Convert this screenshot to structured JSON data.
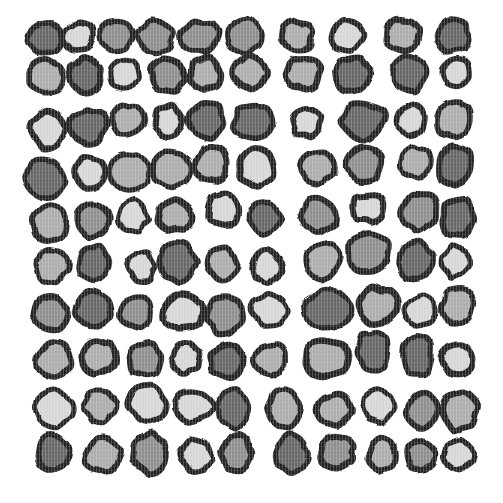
{
  "canvas": {
    "width": 503,
    "height": 503,
    "background": "#ffffff"
  },
  "palette": {
    "outline": "#212121",
    "fills": {
      "L": "#d6d6d6",
      "M": "#acacac",
      "D": "#8e8e8e",
      "K": "#666666"
    }
  },
  "render": {
    "stroke_width_min": 5.0,
    "stroke_width_max": 6.5,
    "wobble": 0.24,
    "points_per_blob": 12,
    "roughen_base_frequency": 0.045,
    "roughen_scale": 5
  },
  "pebble_fields": [
    "x",
    "y",
    "rx",
    "ry",
    "shade"
  ],
  "pebbles": [
    [
      45,
      38,
      17,
      16,
      "K"
    ],
    [
      79,
      37,
      15,
      14,
      "L"
    ],
    [
      116,
      37,
      16,
      15,
      "D"
    ],
    [
      155,
      37,
      18,
      16,
      "D"
    ],
    [
      200,
      37,
      18,
      16,
      "D"
    ],
    [
      245,
      36,
      17,
      16,
      "D"
    ],
    [
      297,
      36,
      16,
      15,
      "M"
    ],
    [
      348,
      35,
      16,
      15,
      "L"
    ],
    [
      403,
      36,
      17,
      16,
      "M"
    ],
    [
      452,
      36,
      17,
      16,
      "K"
    ],
    [
      47,
      77,
      18,
      17,
      "M"
    ],
    [
      85,
      75,
      17,
      17,
      "K"
    ],
    [
      125,
      74,
      15,
      15,
      "L"
    ],
    [
      167,
      76,
      17,
      16,
      "D"
    ],
    [
      205,
      74,
      15,
      16,
      "M"
    ],
    [
      250,
      73,
      16,
      16,
      "M"
    ],
    [
      303,
      73,
      17,
      16,
      "M"
    ],
    [
      353,
      75,
      18,
      17,
      "K"
    ],
    [
      409,
      74,
      17,
      17,
      "K"
    ],
    [
      457,
      72,
      14,
      14,
      "L"
    ],
    [
      48,
      130,
      16,
      19,
      "L"
    ],
    [
      88,
      126,
      17,
      17,
      "K"
    ],
    [
      128,
      120,
      16,
      15,
      "M"
    ],
    [
      168,
      121,
      14,
      15,
      "L"
    ],
    [
      207,
      120,
      17,
      18,
      "K"
    ],
    [
      254,
      122,
      20,
      18,
      "K"
    ],
    [
      307,
      122,
      14,
      14,
      "L"
    ],
    [
      363,
      121,
      21,
      19,
      "K"
    ],
    [
      411,
      120,
      14,
      15,
      "L"
    ],
    [
      454,
      120,
      17,
      18,
      "M"
    ],
    [
      45,
      178,
      18,
      20,
      "K"
    ],
    [
      90,
      172,
      14,
      15,
      "L"
    ],
    [
      130,
      172,
      19,
      19,
      "M"
    ],
    [
      172,
      170,
      18,
      18,
      "M"
    ],
    [
      211,
      165,
      17,
      17,
      "M"
    ],
    [
      257,
      168,
      17,
      19,
      "L"
    ],
    [
      317,
      167,
      17,
      16,
      "M"
    ],
    [
      365,
      165,
      17,
      16,
      "D"
    ],
    [
      416,
      162,
      15,
      15,
      "M"
    ],
    [
      455,
      165,
      17,
      19,
      "K"
    ],
    [
      50,
      222,
      17,
      18,
      "M"
    ],
    [
      93,
      220,
      17,
      16,
      "D"
    ],
    [
      133,
      216,
      15,
      16,
      "L"
    ],
    [
      175,
      215,
      17,
      16,
      "M"
    ],
    [
      223,
      210,
      16,
      16,
      "L"
    ],
    [
      265,
      218,
      16,
      17,
      "K"
    ],
    [
      318,
      215,
      18,
      17,
      "D"
    ],
    [
      369,
      208,
      17,
      14,
      "L"
    ],
    [
      420,
      212,
      18,
      18,
      "D"
    ],
    [
      458,
      217,
      16,
      19,
      "K"
    ],
    [
      51,
      266,
      17,
      16,
      "M"
    ],
    [
      94,
      263,
      16,
      18,
      "K"
    ],
    [
      141,
      266,
      14,
      14,
      "L"
    ],
    [
      177,
      262,
      18,
      20,
      "K"
    ],
    [
      222,
      263,
      15,
      16,
      "M"
    ],
    [
      266,
      266,
      14,
      16,
      "L"
    ],
    [
      323,
      260,
      18,
      17,
      "M"
    ],
    [
      369,
      253,
      21,
      20,
      "D"
    ],
    [
      416,
      261,
      16,
      19,
      "K"
    ],
    [
      456,
      262,
      14,
      15,
      "L"
    ],
    [
      50,
      314,
      17,
      17,
      "D"
    ],
    [
      93,
      309,
      18,
      17,
      "K"
    ],
    [
      136,
      313,
      16,
      15,
      "D"
    ],
    [
      184,
      313,
      20,
      17,
      "L"
    ],
    [
      225,
      315,
      17,
      19,
      "D"
    ],
    [
      270,
      311,
      17,
      16,
      "L"
    ],
    [
      327,
      310,
      22,
      20,
      "K"
    ],
    [
      377,
      306,
      19,
      18,
      "M"
    ],
    [
      421,
      310,
      15,
      14,
      "L"
    ],
    [
      458,
      306,
      16,
      17,
      "M"
    ],
    [
      53,
      361,
      18,
      18,
      "M"
    ],
    [
      99,
      358,
      17,
      16,
      "M"
    ],
    [
      145,
      360,
      16,
      16,
      "D"
    ],
    [
      186,
      358,
      14,
      15,
      "L"
    ],
    [
      227,
      361,
      18,
      16,
      "K"
    ],
    [
      270,
      360,
      17,
      16,
      "M"
    ],
    [
      327,
      359,
      22,
      18,
      "M"
    ],
    [
      373,
      351,
      16,
      19,
      "K"
    ],
    [
      417,
      356,
      15,
      19,
      "K"
    ],
    [
      457,
      360,
      15,
      16,
      "L"
    ],
    [
      53,
      408,
      18,
      18,
      "L"
    ],
    [
      100,
      406,
      16,
      16,
      "M"
    ],
    [
      148,
      404,
      18,
      17,
      "L"
    ],
    [
      194,
      406,
      18,
      16,
      "L"
    ],
    [
      234,
      409,
      16,
      19,
      "K"
    ],
    [
      284,
      408,
      17,
      20,
      "M"
    ],
    [
      334,
      410,
      16,
      16,
      "M"
    ],
    [
      378,
      406,
      15,
      16,
      "L"
    ],
    [
      422,
      411,
      15,
      18,
      "D"
    ],
    [
      460,
      411,
      17,
      19,
      "M"
    ],
    [
      53,
      453,
      16,
      18,
      "K"
    ],
    [
      103,
      455,
      18,
      17,
      "M"
    ],
    [
      150,
      453,
      17,
      19,
      "D"
    ],
    [
      196,
      455,
      16,
      16,
      "L"
    ],
    [
      236,
      453,
      14,
      18,
      "D"
    ],
    [
      291,
      454,
      16,
      19,
      "K"
    ],
    [
      337,
      452,
      17,
      15,
      "D"
    ],
    [
      382,
      454,
      14,
      16,
      "M"
    ],
    [
      421,
      456,
      14,
      14,
      "D"
    ],
    [
      458,
      455,
      15,
      14,
      "L"
    ]
  ]
}
